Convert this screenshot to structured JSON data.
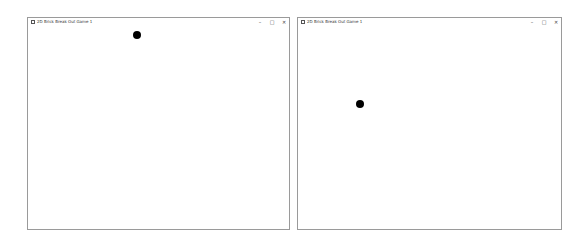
{
  "windows": [
    {
      "title": "2D Brick Break Out Game 1",
      "controls": {
        "minimize": "–",
        "maximize": "□",
        "close": "✕"
      },
      "ball": {
        "x": 109,
        "y": 17,
        "color": "#000000"
      }
    },
    {
      "title": "2D Brick Break Out Game 1",
      "controls": {
        "minimize": "–",
        "maximize": "□",
        "close": "✕"
      },
      "ball": {
        "x": 62,
        "y": 86,
        "color": "#000000"
      }
    }
  ]
}
